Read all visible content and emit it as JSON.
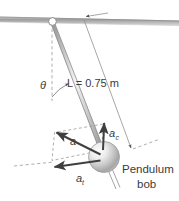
{
  "figure": {
    "name": "simple-pendulum-acceleration-diagram",
    "labels": {
      "length": "L = 0.75 m",
      "angle": "θ",
      "acceleration_resultant": "a",
      "acceleration_centripetal": "a",
      "acceleration_centripetal_sub": "c",
      "acceleration_tangential": "a",
      "acceleration_tangential_sub": "t",
      "bob_caption_line1": "Pendulum",
      "bob_caption_line2": "bob"
    },
    "values": {
      "length_value": "0.75",
      "length_unit": "m",
      "length_symbol": "L"
    },
    "colors": {
      "ink": "#3b3b3b",
      "line": "#7d7d7d",
      "dash": "#9a9a9a",
      "ceiling_dark": "#a8a8a8",
      "ceiling_light": "#e6e6e6",
      "bob_light": "#f2f2f2",
      "bob_dark": "#9d9d9d",
      "arrow": "#4a4a4a",
      "background": "#ffffff"
    },
    "parts": [
      "ceiling",
      "pivot",
      "rod",
      "bob",
      "vertical-reference-dashed-line",
      "angle-arc",
      "length-dimension-line",
      "acceleration-parallelogram",
      "resultant-acceleration-vector",
      "centripetal-acceleration-vector",
      "tangential-acceleration-vector",
      "tangent-dashed-line",
      "bob-stem"
    ]
  }
}
